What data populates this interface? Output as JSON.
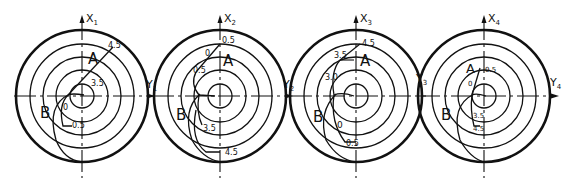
{
  "figure": {
    "type": "polar-diagram-series",
    "panels": [
      {
        "id": 1,
        "center": [
          82,
          96
        ],
        "axis_x_label": "X",
        "axis_x_sub": "1",
        "axis_y_label": "Y",
        "axis_y_sub": "1",
        "point_a": "A",
        "point_b": "B",
        "values": [
          "4.5",
          "3.5",
          "0",
          "0.5"
        ]
      },
      {
        "id": 2,
        "center": [
          220,
          96
        ],
        "axis_x_label": "X",
        "axis_x_sub": "2",
        "axis_y_label": "Y",
        "axis_y_sub": "2",
        "point_a": "A",
        "point_b": "B",
        "values": [
          "0.5",
          "0",
          "0.5",
          "3.5",
          "4.5"
        ]
      },
      {
        "id": 3,
        "center": [
          356,
          96
        ],
        "axis_x_label": "X",
        "axis_x_sub": "3",
        "axis_y_label": "Y",
        "axis_y_sub": "3",
        "point_a": "A",
        "point_b": "B",
        "values": [
          "4.5",
          "3.5",
          "3.0",
          "0",
          "0.5"
        ]
      },
      {
        "id": 4,
        "center": [
          484,
          96
        ],
        "axis_x_label": "X",
        "axis_x_sub": "4",
        "axis_y_label": "Y",
        "axis_y_sub": "4",
        "point_a": "A",
        "point_b": "B",
        "values": [
          "0.5",
          "0",
          "3.5",
          "4.5"
        ]
      }
    ],
    "colors": {
      "ink": "#111111",
      "paper": "#ffffff"
    }
  }
}
